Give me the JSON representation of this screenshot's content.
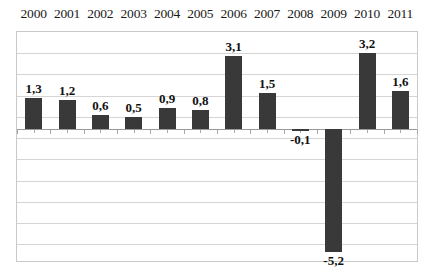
{
  "chart_data": {
    "type": "bar",
    "title": "",
    "subtitle": "",
    "xlabel": "",
    "ylabel": "",
    "categories": [
      "2000",
      "2001",
      "2002",
      "2003",
      "2004",
      "2005",
      "2006",
      "2007",
      "2008",
      "2009",
      "2010",
      "2011"
    ],
    "values": [
      1.3,
      1.2,
      0.6,
      0.5,
      0.9,
      0.8,
      3.1,
      1.5,
      -0.1,
      -5.2,
      3.2,
      1.6
    ],
    "data_labels": [
      "1,3",
      "1,2",
      "0,6",
      "0,5",
      "0,9",
      "0,8",
      "3,1",
      "1,5",
      "-0,1",
      "-5,2",
      "3,2",
      "1,6"
    ],
    "decimal_separator": ",",
    "ylim": [
      -5.6,
      4.1
    ],
    "grid": true,
    "gridlines": [
      4.1,
      3.2,
      2.3,
      1.4,
      0.5,
      -0.4,
      -1.3,
      -2.2,
      -3.1,
      -4.0,
      -4.9
    ],
    "legend": null,
    "legend_position": "none",
    "series": [
      {
        "name": "",
        "color": "#393939",
        "values": [
          1.3,
          1.2,
          0.6,
          0.5,
          0.9,
          0.8,
          3.1,
          1.5,
          -0.1,
          -5.2,
          3.2,
          1.6
        ]
      }
    ],
    "colors": {
      "bar": "#393939",
      "grid": "#d5d5d5",
      "axis": "#9a9a9a",
      "frame": "#c9c9c9",
      "text": "#111111",
      "background": "#ffffff"
    },
    "category_axis_position": "top"
  }
}
